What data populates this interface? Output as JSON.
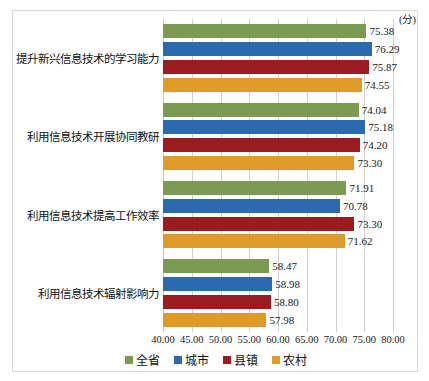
{
  "chart_data": {
    "type": "bar",
    "orientation": "horizontal",
    "title": "",
    "subtitle": "",
    "xlabel": "(分)",
    "ylabel": "",
    "xlim": [
      40.0,
      80.0
    ],
    "xticks": [
      "40.00",
      "45.00",
      "50.00",
      "55.00",
      "60.00",
      "65.00",
      "70.00",
      "75.00",
      "80.00"
    ],
    "xtick_values": [
      40,
      45,
      50,
      55,
      60,
      65,
      70,
      75,
      80
    ],
    "grid": true,
    "legend_position": "bottom",
    "categories": [
      "提升新兴信息技术的学习能力",
      "利用信息技术开展协同教研",
      "利用信息技术提高工作效率",
      "利用信息技术辐射影响力"
    ],
    "series": [
      {
        "name": "全省",
        "color": "#7C9A51",
        "values": [
          75.38,
          74.04,
          71.91,
          58.47
        ],
        "labels": [
          "75.38",
          "74.04",
          "71.91",
          "58.47"
        ]
      },
      {
        "name": "城市",
        "color": "#2B6AAE",
        "values": [
          76.29,
          75.18,
          70.78,
          58.98
        ],
        "labels": [
          "76.29",
          "75.18",
          "70.78",
          "58.98"
        ]
      },
      {
        "name": "县镇",
        "color": "#9C1B1F",
        "values": [
          75.87,
          74.2,
          73.3,
          58.8
        ],
        "labels": [
          "75.87",
          "74.20",
          "73.30",
          "58.80"
        ]
      },
      {
        "name": "农村",
        "color": "#E09A28",
        "values": [
          74.55,
          73.3,
          71.62,
          57.98
        ],
        "labels": [
          "74.55",
          "73.30",
          "71.62",
          "57.98"
        ]
      }
    ]
  },
  "legend": {
    "items": [
      {
        "label": "全省",
        "color": "#7C9A51"
      },
      {
        "label": "城市",
        "color": "#2B6AAE"
      },
      {
        "label": "县镇",
        "color": "#9C1B1F"
      },
      {
        "label": "农村",
        "color": "#E09A28"
      }
    ]
  },
  "axis": {
    "unit": "(分)"
  }
}
